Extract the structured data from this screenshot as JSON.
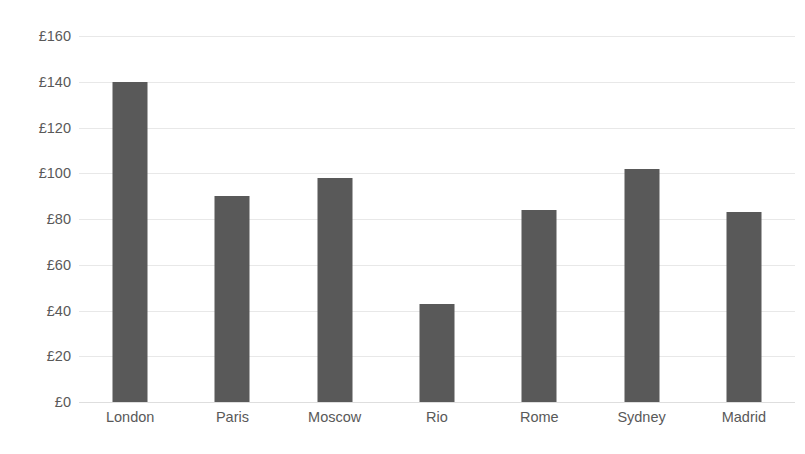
{
  "chart_data": {
    "type": "bar",
    "title": "",
    "subtitle": "",
    "xlabel": "",
    "ylabel": "",
    "categories": [
      "London",
      "Paris",
      "Moscow",
      "Rio",
      "Rome",
      "Sydney",
      "Madrid"
    ],
    "values": [
      140,
      90,
      98,
      43,
      84,
      102,
      83
    ],
    "series": [
      {
        "name": "Price",
        "values": [
          140,
          90,
          98,
          43,
          84,
          102,
          83
        ]
      }
    ],
    "ylim": [
      0,
      160
    ],
    "ytick_values": [
      0,
      20,
      40,
      60,
      80,
      100,
      120,
      140,
      160
    ],
    "ytick_labels": [
      "£0",
      "£20",
      "£40",
      "£60",
      "£80",
      "£100",
      "£120",
      "£140",
      "£160"
    ],
    "currency_symbol": "£",
    "grid": true,
    "grid_axis": "y",
    "legend": false,
    "legend_position": "none",
    "bar_color": "#595959",
    "gridline_color": "#e8e8e8",
    "background_color": "#ffffff",
    "text_color": "#595959"
  }
}
